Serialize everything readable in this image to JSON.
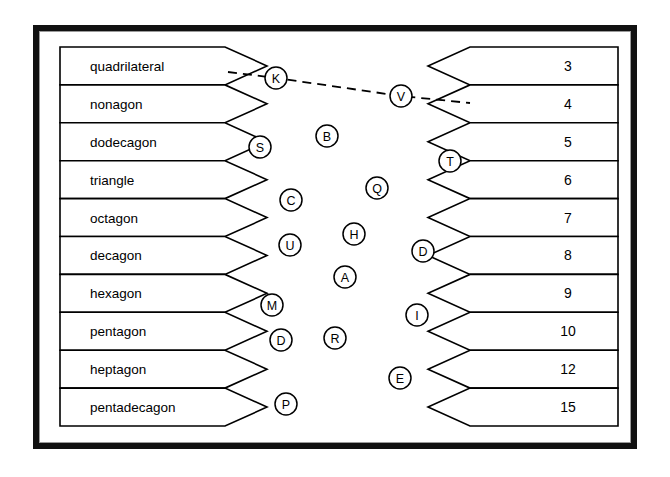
{
  "frame": {
    "border_color": "#111111",
    "inner_border_color": "#9a9a9a",
    "background": "#ffffff"
  },
  "left_column": {
    "name": "polygon-name-list",
    "items": [
      {
        "label": "quadrilateral"
      },
      {
        "label": "nonagon"
      },
      {
        "label": "dodecagon"
      },
      {
        "label": "triangle"
      },
      {
        "label": "octagon"
      },
      {
        "label": "decagon"
      },
      {
        "label": "hexagon"
      },
      {
        "label": "pentagon"
      },
      {
        "label": "heptagon"
      },
      {
        "label": "pentadecagon"
      }
    ]
  },
  "right_column": {
    "name": "side-count-list",
    "items": [
      {
        "label": "3"
      },
      {
        "label": "4"
      },
      {
        "label": "5"
      },
      {
        "label": "6"
      },
      {
        "label": "7"
      },
      {
        "label": "8"
      },
      {
        "label": "9"
      },
      {
        "label": "10"
      },
      {
        "label": "12"
      },
      {
        "label": "15"
      }
    ]
  },
  "tokens": [
    {
      "letter": "K",
      "x": 276,
      "y": 78,
      "r": 11
    },
    {
      "letter": "V",
      "x": 401,
      "y": 96,
      "r": 11
    },
    {
      "letter": "S",
      "x": 260,
      "y": 147,
      "r": 11
    },
    {
      "letter": "B",
      "x": 327,
      "y": 136,
      "r": 11
    },
    {
      "letter": "T",
      "x": 450,
      "y": 161,
      "r": 11
    },
    {
      "letter": "C",
      "x": 291,
      "y": 200,
      "r": 11
    },
    {
      "letter": "Q",
      "x": 377,
      "y": 188,
      "r": 11
    },
    {
      "letter": "H",
      "x": 354,
      "y": 234,
      "r": 11
    },
    {
      "letter": "U",
      "x": 290,
      "y": 245,
      "r": 11
    },
    {
      "letter": "D",
      "x": 423,
      "y": 251,
      "r": 11
    },
    {
      "letter": "A",
      "x": 345,
      "y": 277,
      "r": 11
    },
    {
      "letter": "M",
      "x": 272,
      "y": 305,
      "r": 11
    },
    {
      "letter": "I",
      "x": 417,
      "y": 315,
      "r": 11
    },
    {
      "letter": "D",
      "x": 281,
      "y": 340,
      "r": 11
    },
    {
      "letter": "R",
      "x": 335,
      "y": 338,
      "r": 11
    },
    {
      "letter": "E",
      "x": 400,
      "y": 378,
      "r": 11
    },
    {
      "letter": "P",
      "x": 286,
      "y": 404,
      "r": 11
    }
  ],
  "connection": {
    "name": "quadrilateral-to-4-link",
    "from_label": "quadrilateral",
    "to_label": "4",
    "style": "dashed",
    "waypoints": [
      {
        "x": 228,
        "y": 72
      },
      {
        "x": 276,
        "y": 78
      },
      {
        "x": 401,
        "y": 96
      },
      {
        "x": 470,
        "y": 103
      }
    ]
  },
  "geometry": {
    "left_box": {
      "x": 60,
      "y": 47,
      "width": 165,
      "tip": 42,
      "row_height": 37.9
    },
    "right_box": {
      "x": 470,
      "y": 47,
      "width": 148,
      "notch": 42,
      "row_height": 37.9
    }
  }
}
